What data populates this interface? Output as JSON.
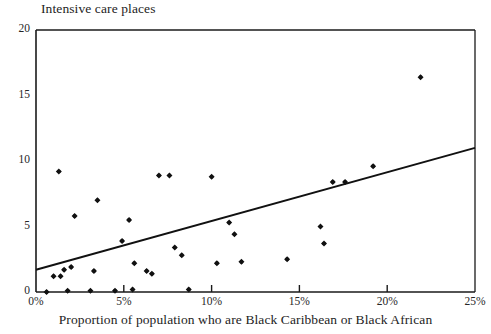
{
  "chart_data": {
    "type": "scatter",
    "title": "Intensive care places",
    "xlabel": "Proportion of population who are Black Caribbean or Black African",
    "ylabel": "",
    "xlim": [
      0,
      25
    ],
    "ylim": [
      0,
      20
    ],
    "grid": false,
    "legend": "none",
    "x_tick_labels": [
      "0%",
      "5%",
      "10%",
      "15%",
      "20%",
      "25%"
    ],
    "x_tick_values": [
      0,
      5,
      10,
      15,
      20,
      25
    ],
    "y_tick_labels": [
      "0",
      "5",
      "10",
      "15",
      "20"
    ],
    "y_tick_values": [
      0,
      5,
      10,
      15,
      20
    ],
    "marker": "filled-diamond",
    "marker_color": "#111111",
    "points": [
      {
        "x": 0.6,
        "y": 0.0
      },
      {
        "x": 1.0,
        "y": 1.2
      },
      {
        "x": 1.3,
        "y": 9.2
      },
      {
        "x": 1.4,
        "y": 1.2
      },
      {
        "x": 1.6,
        "y": 1.7
      },
      {
        "x": 1.8,
        "y": 0.1
      },
      {
        "x": 2.0,
        "y": 1.9
      },
      {
        "x": 2.2,
        "y": 5.8
      },
      {
        "x": 3.1,
        "y": 0.1
      },
      {
        "x": 3.3,
        "y": 1.6
      },
      {
        "x": 3.5,
        "y": 7.0
      },
      {
        "x": 4.5,
        "y": 0.1
      },
      {
        "x": 4.9,
        "y": 3.9
      },
      {
        "x": 5.3,
        "y": 5.5
      },
      {
        "x": 5.5,
        "y": 0.2
      },
      {
        "x": 5.6,
        "y": 2.2
      },
      {
        "x": 6.3,
        "y": 1.6
      },
      {
        "x": 6.6,
        "y": 1.4
      },
      {
        "x": 7.0,
        "y": 8.9
      },
      {
        "x": 7.6,
        "y": 8.9
      },
      {
        "x": 7.9,
        "y": 3.4
      },
      {
        "x": 8.3,
        "y": 2.8
      },
      {
        "x": 8.7,
        "y": 0.2
      },
      {
        "x": 10.0,
        "y": 8.8
      },
      {
        "x": 10.3,
        "y": 2.2
      },
      {
        "x": 11.0,
        "y": 5.3
      },
      {
        "x": 11.3,
        "y": 4.4
      },
      {
        "x": 11.7,
        "y": 2.3
      },
      {
        "x": 14.3,
        "y": 2.5
      },
      {
        "x": 16.2,
        "y": 5.0
      },
      {
        "x": 16.4,
        "y": 3.7
      },
      {
        "x": 16.9,
        "y": 8.4
      },
      {
        "x": 17.6,
        "y": 8.4
      },
      {
        "x": 19.2,
        "y": 9.6
      },
      {
        "x": 21.9,
        "y": 16.4
      }
    ],
    "trend_line": {
      "x_start": 0,
      "y_start": 1.7,
      "x_end": 25,
      "y_end": 11.0,
      "color": "#111111"
    }
  }
}
